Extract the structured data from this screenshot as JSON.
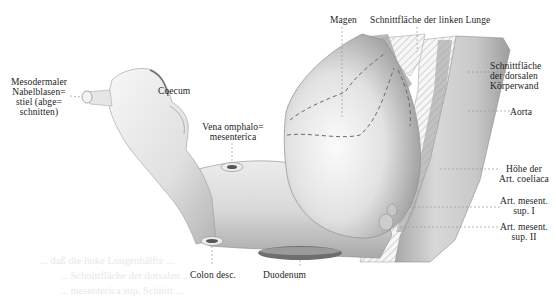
{
  "figure": {
    "labels": {
      "mesodermaler": "Mesodermaler\nNabelblasen=\nstiel (abge=\nschnitten)",
      "coecum": "Coecum",
      "vena": "Vena omphalo=\nmesenterica",
      "magen": "Magen",
      "schnittflaeche_lunge": "Schnittfläche der linken Lunge",
      "schnittflaeche_koerperwand": "Schnittfläche\nder dorsalen\nKörperwand",
      "aorta": "Aorta",
      "hoehe_coeliaca": "Höhe der\nArt. coeliaca",
      "mesent_1": "Art. mesent.\nsup. I",
      "mesent_2": "Art. mesent.\nsup. II",
      "colon": "Colon desc.",
      "duodenum": "Duodenum"
    },
    "colors": {
      "tissue_light": "#f2f2f2",
      "tissue_mid": "#cfcfcf",
      "tissue_dark": "#8a8a8a",
      "hatch": "#b5b5b5",
      "leader": "#9a9a9a",
      "text": "#1c1c1c"
    }
  },
  "background_text": {
    "lines": [
      "... daß die linke Lungenhälfte ...",
      "... Schnittfläche der dorsalen ...",
      "... mesenterica sup. Schnitt ..."
    ]
  }
}
